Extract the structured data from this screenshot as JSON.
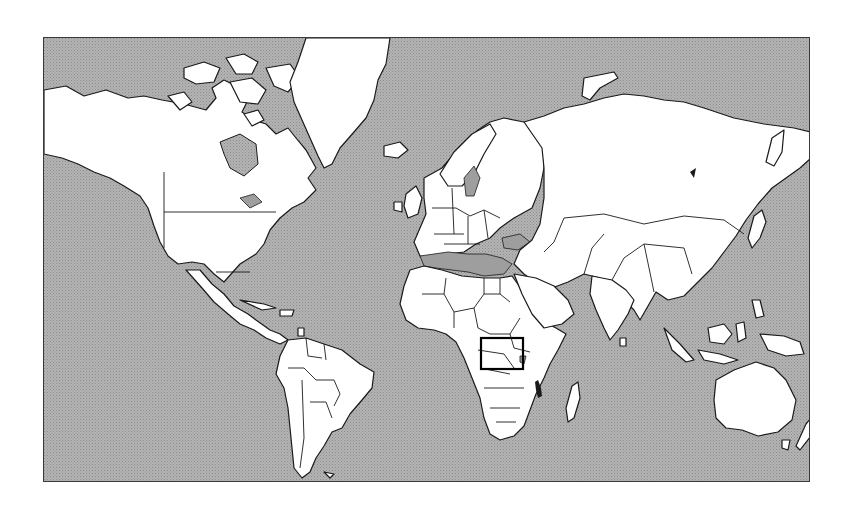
{
  "map": {
    "projection": "Mercator world map",
    "ocean_color": "#a9a9a9",
    "land_color": "#ffffff",
    "outline_color": "#1a1a1a",
    "frame": {
      "x": 43,
      "y": 37,
      "width": 767,
      "height": 445
    },
    "highlight_region": {
      "label": "Southeastern Africa (Malawi / Zambia area)",
      "box": {
        "x": 480,
        "y": 337,
        "width": 42,
        "height": 31
      },
      "stroke_color": "#000000"
    },
    "continents": [
      "North America",
      "South America",
      "Greenland",
      "Europe",
      "Africa",
      "Asia",
      "Australia"
    ]
  }
}
